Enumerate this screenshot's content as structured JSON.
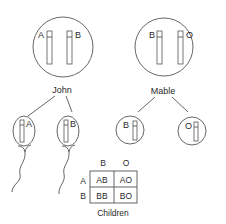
{
  "parents": {
    "father": {
      "name": "John",
      "alleles": [
        "A",
        "B"
      ]
    },
    "mother": {
      "name": "Mable",
      "alleles": [
        "B",
        "O"
      ]
    }
  },
  "gametes": {
    "sperm": [
      {
        "allele": "A"
      },
      {
        "allele": "B"
      }
    ],
    "eggs": [
      {
        "allele": "B"
      },
      {
        "allele": "O"
      }
    ]
  },
  "punnett": {
    "col_headers": [
      "B",
      "O"
    ],
    "row_headers": [
      "A",
      "B"
    ],
    "cells": [
      [
        "AB",
        "AO"
      ],
      [
        "BB",
        "BO"
      ]
    ],
    "caption": "Children"
  },
  "colors": {
    "line": "#555555",
    "text": "#2a2a2a",
    "background": "#ffffff"
  }
}
